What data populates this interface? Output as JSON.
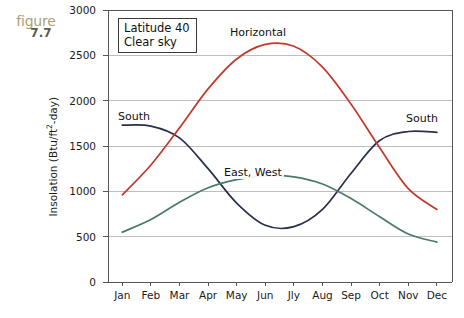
{
  "figure": {
    "word": "figure",
    "number": "7.7",
    "tag_color": "#a9a074"
  },
  "chart_data": {
    "type": "line",
    "title": "",
    "xlabel": "",
    "ylabel": "Insolation (Btu/ft²-day)",
    "ylabel_prefix": "Insolation (Btu/ft",
    "ylabel_sup": "2",
    "ylabel_suffix": "-day)",
    "grid": true,
    "legend_position": "inline-annotations",
    "annotation": {
      "line1": "Latitude 40",
      "line2": "Clear sky"
    },
    "categories": [
      "Jan",
      "Feb",
      "Mar",
      "Apr",
      "May",
      "Jun",
      "Jly",
      "Aug",
      "Sep",
      "Oct",
      "Nov",
      "Dec"
    ],
    "ylim": [
      0,
      3000
    ],
    "yticks": [
      0,
      500,
      1000,
      1500,
      2000,
      2500,
      3000
    ],
    "ytick_labels": [
      "0",
      "500",
      "1000",
      "1500",
      "2000",
      "2500",
      "3000"
    ],
    "series": [
      {
        "name": "South",
        "color": "#2b2f4e",
        "label_left": "South",
        "label_right": "South",
        "values": [
          1730,
          1720,
          1590,
          1250,
          870,
          625,
          610,
          800,
          1200,
          1560,
          1660,
          1650
        ]
      },
      {
        "name": "Horizontal",
        "color": "#c0392b",
        "label": "Horizontal",
        "values": [
          960,
          1290,
          1700,
          2130,
          2460,
          2620,
          2600,
          2370,
          1960,
          1480,
          1030,
          800
        ]
      },
      {
        "name": "East, West",
        "color": "#4a7a68",
        "label": "East, West",
        "values": [
          550,
          690,
          880,
          1040,
          1130,
          1170,
          1160,
          1080,
          920,
          720,
          530,
          440
        ]
      }
    ]
  },
  "axes": {
    "frame_color": "#555555",
    "grid_color": "#bdbdbd"
  }
}
